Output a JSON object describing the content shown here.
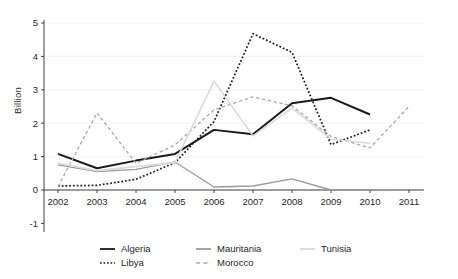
{
  "chart_data": {
    "type": "line",
    "title": "",
    "xlabel": "",
    "ylabel": "Billion",
    "x": [
      2002,
      2003,
      2004,
      2005,
      2006,
      2007,
      2008,
      2009,
      2010,
      2011
    ],
    "xtick_labels": [
      "2002",
      "2003",
      "2004",
      "2005",
      "2006",
      "2007",
      "2008",
      "2009",
      "2010",
      "2011"
    ],
    "ytick_labels": [
      "-1",
      "0",
      "1",
      "2",
      "3",
      "4",
      "5"
    ],
    "ytick_values": [
      -1,
      0,
      1,
      2,
      3,
      4,
      5
    ],
    "ylim": [
      -1,
      5
    ],
    "xlim": [
      2002,
      2011
    ],
    "grid": true,
    "legend_position": "bottom",
    "series": [
      {
        "name": "Algeria",
        "style": "solid",
        "color": "#1a1a1a",
        "width": 2.0,
        "x": [
          2002,
          2003,
          2004,
          2005,
          2006,
          2007,
          2008,
          2009,
          2010
        ],
        "values": [
          1.08,
          0.65,
          0.88,
          1.08,
          1.8,
          1.67,
          2.6,
          2.76,
          2.26
        ]
      },
      {
        "name": "Libya",
        "style": "dotted",
        "color": "#1a1a1a",
        "width": 1.7,
        "x": [
          2002,
          2003,
          2004,
          2005,
          2006,
          2007,
          2008,
          2009,
          2010
        ],
        "values": [
          0.12,
          0.14,
          0.32,
          0.82,
          2.05,
          4.68,
          4.12,
          1.36,
          1.8
        ]
      },
      {
        "name": "Mauritania",
        "style": "solid",
        "color": "#9a9a9a",
        "width": 1.3,
        "x": [
          2002,
          2003,
          2004,
          2005,
          2006,
          2007,
          2008,
          2009,
          2010
        ],
        "values": [
          0.75,
          0.55,
          0.62,
          0.84,
          0.09,
          0.12,
          0.33,
          0.0,
          0.0
        ]
      },
      {
        "name": "Morocco",
        "style": "dashed",
        "color": "#a8a8a8",
        "width": 1.3,
        "x": [
          2002,
          2003,
          2004,
          2005,
          2006,
          2007,
          2008,
          2009,
          2010,
          2011
        ],
        "values": [
          0.1,
          2.31,
          0.8,
          1.35,
          2.4,
          2.79,
          2.52,
          1.6,
          1.26,
          2.5
        ]
      },
      {
        "name": "Tunisia",
        "style": "solid",
        "color": "#dadada",
        "width": 1.6,
        "x": [
          2002,
          2003,
          2004,
          2005,
          2006,
          2007,
          2008,
          2009,
          2010
        ],
        "values": [
          0.8,
          0.58,
          0.7,
          0.82,
          3.26,
          1.62,
          2.45,
          1.52,
          1.4
        ]
      }
    ],
    "legend_entries": [
      {
        "label": "Algeria",
        "style": "solid",
        "color": "#1a1a1a"
      },
      {
        "label": "Libya",
        "style": "dotted",
        "color": "#1a1a1a"
      },
      {
        "label": "Mauritania",
        "style": "solid",
        "color": "#9a9a9a"
      },
      {
        "label": "Morocco",
        "style": "dashed",
        "color": "#a8a8a8"
      },
      {
        "label": "Tunisia",
        "style": "solid",
        "color": "#dadada"
      }
    ]
  }
}
